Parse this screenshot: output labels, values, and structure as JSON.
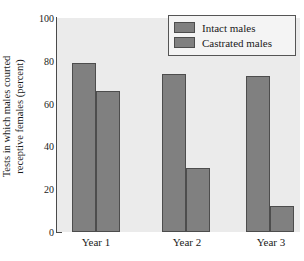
{
  "chart_data": {
    "type": "bar",
    "title": "",
    "xlabel": "",
    "ylabel": "Tests in which males courted receptive females (percent)",
    "ylabel_line1": "Tests in which males courted",
    "ylabel_line2": "receptive females (percent)",
    "categories": [
      "Year 1",
      "Year 2",
      "Year 3"
    ],
    "series": [
      {
        "name": "Intact males",
        "values": [
          79,
          74,
          73
        ]
      },
      {
        "name": "Castrated males",
        "values": [
          66,
          30,
          12
        ]
      }
    ],
    "ylim": [
      0,
      100
    ],
    "yticks": [
      0,
      20,
      40,
      60,
      80,
      100
    ],
    "ytick_labels": [
      "0",
      "20",
      "40",
      "60",
      "80",
      "100"
    ],
    "grid": false,
    "legend_position": "top-right",
    "colors": {
      "bar_fill": "#808080",
      "bar_edge": "#4d4d4d",
      "plot_background": "#ebebeb",
      "axis": "#4a4a4a",
      "text": "#1a1a1a",
      "legend_background": "#f4f4f4",
      "legend_border": "#555555"
    }
  },
  "legend": {
    "entries": [
      {
        "label": "Intact males"
      },
      {
        "label": "Castrated males"
      }
    ]
  },
  "y_axis": {
    "title_line1": "Tests in which males courted",
    "title_line2": "receptive females (percent)",
    "tick_labels": [
      "100",
      "80",
      "60",
      "40",
      "20",
      "0"
    ]
  },
  "x_axis": {
    "tick_labels": [
      "Year 1",
      "Year 2",
      "Year 3"
    ]
  }
}
